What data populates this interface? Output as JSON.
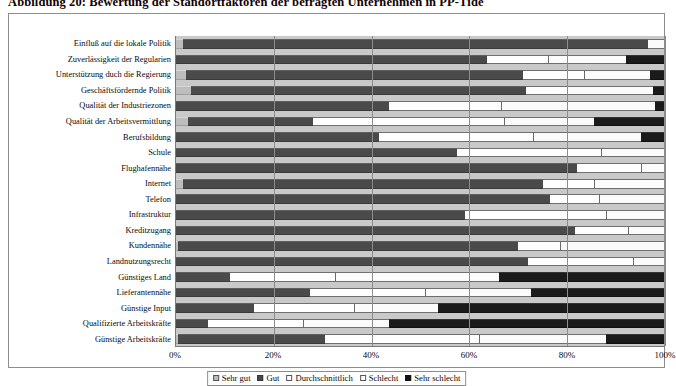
{
  "title": "Abbildung 20: Bewertung der Standortfaktoren der befragten Unternehmen in PP-Tide",
  "legend": {
    "items": [
      {
        "label": "Sehr gut",
        "color": "#bdbdbd"
      },
      {
        "label": "Gut",
        "color": "#4a4a4a"
      },
      {
        "label": "Durchschnittlich",
        "color": "#ffffff"
      },
      {
        "label": "Schlecht",
        "color": "#fbfbfb"
      },
      {
        "label": "Sehr schlecht",
        "color": "#1b1b1b"
      }
    ]
  },
  "chart_data": {
    "type": "bar",
    "orientation": "horizontal",
    "stacked": true,
    "normalized": "100%",
    "title": "Abbildung 20: Bewertung der Standortfaktoren der befragten Unternehmen in PP-Tide",
    "xlabel": "",
    "ylabel": "",
    "xlim": [
      0,
      100
    ],
    "xticks": [
      0,
      20,
      40,
      60,
      80,
      100
    ],
    "xticklabels": [
      "0%",
      "20%",
      "40%",
      "60%",
      "80%",
      "100%"
    ],
    "grid": true,
    "legend_position": "bottom-center",
    "categories": [
      "Einfluß auf die lokale Politik",
      "Zuverlässigkeit der Regularien",
      "Unterstützung duch die Regierung",
      "Geschäftsfördernde Politik",
      "Qualität der Industriezonen",
      "Qualität der Arbeitsvermittlung",
      "Berufsbildung",
      "Schule",
      "Flughafennähe",
      "Internet",
      "Telefon",
      "Infrastruktur",
      "Kreditzugang",
      "Kundennähe",
      "Landnutzungsrecht",
      "Günstiges Land",
      "Lieferantennähe",
      "Günstige Input",
      "Qualifizierte Arbeitskräfte",
      "Günstige Arbeitskräfte"
    ],
    "series": [
      {
        "name": "Sehr gut",
        "values": [
          1.5,
          0.0,
          2.0,
          3.0,
          0.0,
          2.5,
          0.0,
          0.0,
          0.0,
          1.5,
          0.0,
          0.0,
          0.0,
          0.5,
          0.0,
          0.0,
          0.0,
          0.0,
          0.0,
          0.5
        ]
      },
      {
        "name": "Gut",
        "values": [
          95.0,
          63.5,
          69.0,
          68.5,
          43.5,
          25.5,
          41.5,
          57.5,
          82.0,
          73.5,
          76.5,
          59.0,
          81.5,
          69.5,
          72.0,
          11.0,
          27.5,
          16.0,
          6.5,
          30.0
        ]
      },
      {
        "name": "Durchschnittlich",
        "values": [
          0.0,
          12.5,
          12.5,
          8.5,
          23.0,
          39.0,
          31.5,
          29.5,
          13.0,
          10.5,
          10.0,
          29.0,
          11.0,
          8.5,
          21.5,
          21.5,
          23.5,
          20.5,
          19.5,
          31.5
        ]
      },
      {
        "name": "Schlecht",
        "values": [
          3.5,
          16.0,
          13.5,
          17.5,
          31.5,
          18.5,
          22.0,
          13.0,
          5.0,
          14.5,
          13.5,
          12.0,
          7.5,
          21.5,
          6.5,
          33.5,
          21.5,
          17.0,
          17.5,
          26.0
        ]
      },
      {
        "name": "Sehr schlecht",
        "values": [
          0.0,
          8.0,
          3.0,
          2.5,
          2.0,
          14.5,
          5.0,
          0.0,
          0.0,
          0.0,
          0.0,
          0.0,
          0.0,
          0.0,
          0.0,
          34.0,
          27.5,
          46.5,
          56.5,
          12.0
        ]
      }
    ]
  }
}
